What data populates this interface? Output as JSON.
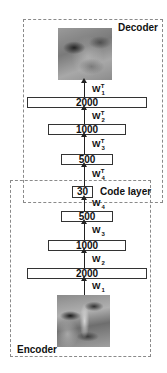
{
  "regions": {
    "decoder": {
      "label": "Decoder"
    },
    "encoder": {
      "label": "Encoder"
    }
  },
  "code_layer": {
    "size": "30",
    "label": "Code layer"
  },
  "decoder_layers": [
    {
      "size": "2000"
    },
    {
      "size": "1000"
    },
    {
      "size": "500"
    }
  ],
  "encoder_layers": [
    {
      "size": "500"
    },
    {
      "size": "1000"
    },
    {
      "size": "2000"
    }
  ],
  "decoder_weights": [
    {
      "base": "W",
      "sub": "1",
      "sup": "T"
    },
    {
      "base": "W",
      "sub": "2",
      "sup": "T"
    },
    {
      "base": "W",
      "sub": "3",
      "sup": "T"
    },
    {
      "base": "W",
      "sub": "4",
      "sup": "T"
    }
  ],
  "encoder_weights": [
    {
      "base": "W",
      "sub": "4"
    },
    {
      "base": "W",
      "sub": "3"
    },
    {
      "base": "W",
      "sub": "2"
    },
    {
      "base": "W",
      "sub": "1"
    }
  ],
  "images": {
    "output": "reconstructed-face",
    "input": "input-face"
  }
}
